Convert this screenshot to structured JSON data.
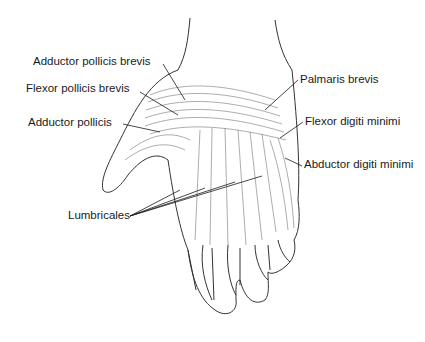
{
  "diagram": {
    "labels": [
      {
        "id": "adductor-pollicis-brevis",
        "text": "Adductor pollicis brevis",
        "x": 33,
        "y": 56
      },
      {
        "id": "flexor-pollicis-brevis",
        "text": "Flexor pollicis brevis",
        "x": 26,
        "y": 83
      },
      {
        "id": "adductor-pollicis",
        "text": "Adductor pollicis",
        "x": 28,
        "y": 117
      },
      {
        "id": "palmaris-brevis",
        "text": "Palmaris brevis",
        "x": 300,
        "y": 74
      },
      {
        "id": "flexor-digiti-minimi",
        "text": "Flexor digiti minimi",
        "x": 305,
        "y": 116
      },
      {
        "id": "abductor-digiti-minimi",
        "text": "Abductor digiti minimi",
        "x": 304,
        "y": 159
      },
      {
        "id": "lumbricales",
        "text": "Lumbricales",
        "x": 68,
        "y": 210
      }
    ],
    "colors": {
      "ink": "#1a1a1a",
      "shade": "#555555",
      "background": "#ffffff"
    }
  }
}
